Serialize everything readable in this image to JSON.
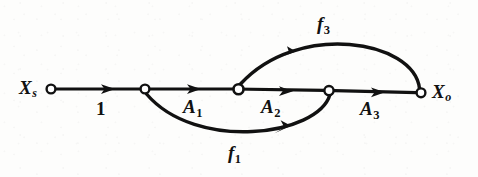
{
  "figure": {
    "type": "signal-flow-graph",
    "background_color": "#fdfdfc",
    "stroke_color": "#111111",
    "node_fill_color": "#ffffff"
  },
  "nodes": [
    {
      "id": "Xs",
      "label_base": "X",
      "label_sub": "s",
      "x": 51,
      "y": 89,
      "r": 4.5,
      "label_x": 20,
      "label_y": 79,
      "label_side": "left"
    },
    {
      "id": "n2",
      "label_base": "",
      "label_sub": "",
      "x": 145,
      "y": 89,
      "r": 4.5
    },
    {
      "id": "n3",
      "label_base": "",
      "label_sub": "",
      "x": 239,
      "y": 89,
      "r": 5.0
    },
    {
      "id": "n4",
      "label_base": "",
      "label_sub": "",
      "x": 329,
      "y": 90,
      "r": 4.5
    },
    {
      "id": "Xo",
      "label_base": "X",
      "label_sub": "o",
      "x": 421,
      "y": 93,
      "r": 4.5,
      "label_x": 432,
      "label_y": 83,
      "label_side": "right"
    }
  ],
  "edges": [
    {
      "id": "e1",
      "from": "Xs",
      "to": "n2",
      "gain": "1",
      "gain_plain": true,
      "gain_x": 96,
      "gain_y": 104,
      "shape": "straight",
      "direction": "forward",
      "arrow_at": 0.52
    },
    {
      "id": "e2",
      "from": "n2",
      "to": "n3",
      "gain_base": "A",
      "gain_sub": "1",
      "gain_x": 184,
      "gain_y": 101,
      "shape": "straight",
      "direction": "forward",
      "arrow_at": 0.52
    },
    {
      "id": "e3",
      "from": "n3",
      "to": "n4",
      "gain_base": "A",
      "gain_sub": "2",
      "gain_x": 262,
      "gain_y": 101,
      "shape": "straight",
      "direction": "forward",
      "arrow_at": 0.52
    },
    {
      "id": "e4",
      "from": "n4",
      "to": "Xo",
      "gain_base": "A",
      "gain_sub": "3",
      "gain_x": 361,
      "gain_y": 102,
      "shape": "straight",
      "direction": "forward",
      "arrow_at": 0.52
    },
    {
      "id": "e5",
      "from": "n4",
      "to": "n2",
      "gain_base": "f",
      "gain_sub": "1",
      "gain_x": 228,
      "gain_y": 144,
      "shape": "arc-below",
      "direction": "feedback",
      "arrow_at": 0.42
    },
    {
      "id": "e6",
      "from": "Xo",
      "to": "n3",
      "gain_base": "f",
      "gain_sub": "3",
      "gain_x": 317,
      "gain_y": 16,
      "shape": "arc-above",
      "direction": "feedback",
      "arrow_at": 0.72
    }
  ],
  "paths": {
    "main_line": "M 55.5 89 L 416.5 92.6",
    "feedback_f1": "M 329 95 C 312 140, 190 150, 146 94",
    "feedback_f3": "M 419 88 C 412 42, 300 22, 241 84",
    "arrow_e1": {
      "x": 110,
      "y": 89.5,
      "angle": 0.57
    },
    "arrow_e2": {
      "x": 196,
      "y": 90.4,
      "angle": 0.57
    },
    "arrow_e3": {
      "x": 288,
      "y": 91.3,
      "angle": 0.57
    },
    "arrow_e4": {
      "x": 380,
      "y": 92.2,
      "angle": 0.57
    },
    "arrow_f1": {
      "x": 281,
      "y": 130.5,
      "angle": 200
    },
    "arrow_f3": {
      "x": 286,
      "y": 55,
      "angle": 196
    }
  },
  "legend": {
    "source_node": "Xs",
    "output_node": "Xo",
    "forward_gains": [
      "1",
      "A1",
      "A2",
      "A3"
    ],
    "feedback_gains": [
      "f1",
      "f3"
    ]
  }
}
